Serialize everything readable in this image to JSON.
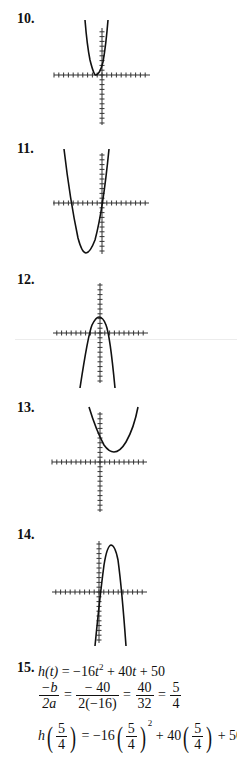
{
  "problems": [
    {
      "number": "10.",
      "type": "graph",
      "description": "upward parabola, vertex slightly left of origin on x-axis"
    },
    {
      "number": "11.",
      "type": "graph",
      "description": "upward parabola, vertex below x-axis to the left"
    },
    {
      "number": "12.",
      "type": "graph",
      "description": "downward parabola, vertex just above origin"
    },
    {
      "number": "13.",
      "type": "graph",
      "description": "upward parabola, vertex above x-axis to the right"
    },
    {
      "number": "14.",
      "type": "graph",
      "description": "downward parabola, vertex high to the right"
    },
    {
      "number": "15.",
      "type": "work"
    }
  ],
  "p15": {
    "line1": {
      "lhs": "h(t)",
      "rhs_a": " = −16",
      "t2": "t",
      "exp": "2",
      "rhs_b": " + 40",
      "t": "t",
      "rhs_c": " + 50"
    },
    "line2": {
      "f1n": "−b",
      "f1d": "2a",
      "eq": "=",
      "f2n": "− 40",
      "f2d": "2(−16)",
      "f3n": "40",
      "f3d": "32",
      "f4n": "5",
      "f4d": "4"
    },
    "line3": {
      "h": "h",
      "fn": "5",
      "fd": "4",
      "mid1": " = −16",
      "exp": "2",
      "mid2": " + 40",
      "tail": " + 50 = 75"
    }
  },
  "colors": {
    "ink": "#111111",
    "axis": "#333333",
    "rule": "#ececec"
  }
}
